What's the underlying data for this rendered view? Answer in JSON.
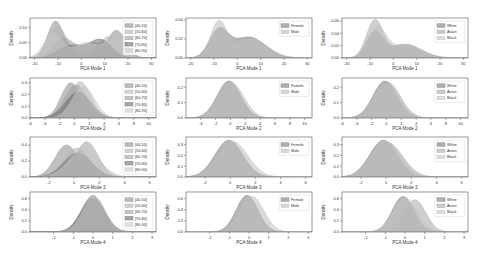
{
  "figure": {
    "rows": 4,
    "cols": 3,
    "ylabel": "Density"
  },
  "legends": {
    "age": [
      "[40-50]",
      "[50-60]",
      "[60-70]",
      "[70-80]",
      "[80-90]"
    ],
    "sex": [
      "Female",
      "Male"
    ],
    "race": [
      "White",
      "Asian",
      "Black"
    ]
  },
  "colors": {
    "age": [
      "#8c8c8c",
      "#b4b4b4",
      "#a0a0a0",
      "#6e6e6e",
      "#c8c8c8"
    ],
    "sex": [
      "#7a7a7a",
      "#bdbdbd"
    ],
    "race": [
      "#7a7a7a",
      "#a8a8a8",
      "#c4c4c4"
    ]
  },
  "chart_data": [
    {
      "type": "area",
      "panel": "r1c1",
      "xlabel": "PCA Mode 1",
      "ylabel": "Density",
      "xlim": [
        -22,
        32
      ],
      "ylim": [
        0,
        0.13
      ],
      "xticks": [
        -20,
        -10,
        0,
        10,
        20,
        30
      ],
      "yticks": [
        0.0,
        0.05,
        0.1
      ],
      "ytick_labels": [
        "0.00",
        "0.05",
        "0.10"
      ],
      "legend_group": "age",
      "series": [
        {
          "name": "[40-50]",
          "peaks": [
            [
              -11,
              0.12,
              3.5
            ],
            [
              15,
              0.09,
              4
            ]
          ]
        },
        {
          "name": "[50-60]",
          "peaks": [
            [
              -10,
              0.1,
              4
            ],
            [
              12,
              0.07,
              5
            ]
          ]
        },
        {
          "name": "[60-70]",
          "peaks": [
            [
              -8,
              0.06,
              4
            ],
            [
              5,
              0.05,
              6
            ]
          ]
        },
        {
          "name": "[70-80]",
          "peaks": [
            [
              -5,
              0.04,
              5
            ],
            [
              8,
              0.06,
              5
            ]
          ]
        },
        {
          "name": "[80-90]",
          "peaks": [
            [
              -12,
              0.08,
              4
            ],
            [
              2,
              0.05,
              5
            ],
            [
              14,
              0.06,
              4
            ]
          ]
        }
      ]
    },
    {
      "type": "area",
      "panel": "r1c2",
      "xlabel": "PCA Mode 1",
      "ylabel": "Density",
      "xlim": [
        -22,
        32
      ],
      "ylim": [
        0,
        0.042
      ],
      "xticks": [
        -20,
        -10,
        0,
        10,
        20,
        30
      ],
      "yticks": [
        0.0,
        0.02,
        0.04
      ],
      "ytick_labels": [
        "0.00",
        "0.02",
        "0.04"
      ],
      "legend_group": "sex",
      "series": [
        {
          "name": "Female",
          "peaks": [
            [
              -8,
              0.028,
              4
            ],
            [
              5,
              0.022,
              7
            ]
          ]
        },
        {
          "name": "Male",
          "peaks": [
            [
              -8,
              0.037,
              3.5
            ],
            [
              6,
              0.02,
              7
            ]
          ]
        }
      ]
    },
    {
      "type": "area",
      "panel": "r1c3",
      "xlabel": "PCA Mode 1",
      "ylabel": "Density",
      "xlim": [
        -22,
        32
      ],
      "ylim": [
        0,
        0.065
      ],
      "xticks": [
        -20,
        -10,
        0,
        10,
        20,
        30
      ],
      "yticks": [
        0.0,
        0.02,
        0.04,
        0.06
      ],
      "ytick_labels": [
        "0.00",
        "0.02",
        "0.04",
        "0.06"
      ],
      "legend_group": "race",
      "series": [
        {
          "name": "White",
          "peaks": [
            [
              -8,
              0.04,
              3.5
            ],
            [
              5,
              0.022,
              7
            ]
          ]
        },
        {
          "name": "Asian",
          "peaks": [
            [
              -8,
              0.06,
              3.5
            ],
            [
              4,
              0.02,
              6
            ]
          ]
        },
        {
          "name": "Black",
          "peaks": [
            [
              -7,
              0.05,
              4
            ],
            [
              6,
              0.022,
              6
            ]
          ]
        }
      ]
    },
    {
      "type": "area",
      "panel": "r2c1",
      "xlabel": "PCA Mode 2",
      "ylabel": "Density",
      "xlim": [
        -6,
        11
      ],
      "ylim": [
        0,
        0.34
      ],
      "xticks": [
        -6,
        -4,
        -2,
        0,
        2,
        4,
        6,
        8,
        10
      ],
      "yticks": [
        0.0,
        0.1,
        0.2,
        0.3
      ],
      "ytick_labels": [
        "0.0",
        "0.1",
        "0.2",
        "0.3"
      ],
      "legend_group": "age",
      "series": [
        {
          "name": "[40-50]",
          "peaks": [
            [
              -0.5,
              0.3,
              1.3
            ]
          ]
        },
        {
          "name": "[50-60]",
          "peaks": [
            [
              0.8,
              0.31,
              1.4
            ]
          ]
        },
        {
          "name": "[60-70]",
          "peaks": [
            [
              0.2,
              0.28,
              1.5
            ]
          ]
        },
        {
          "name": "[70-80]",
          "peaks": [
            [
              0.5,
              0.22,
              1.7
            ]
          ]
        },
        {
          "name": "[80-90]",
          "peaks": [
            [
              1.2,
              0.27,
              1.5
            ]
          ]
        }
      ]
    },
    {
      "type": "area",
      "panel": "r2c2",
      "xlabel": "PCA Mode 2",
      "ylabel": "Density",
      "xlim": [
        -6,
        11
      ],
      "ylim": [
        0,
        0.26
      ],
      "xticks": [
        -4,
        -2,
        0,
        2,
        4,
        6,
        8,
        10
      ],
      "yticks": [
        0.0,
        0.1,
        0.2
      ],
      "ytick_labels": [
        "0.0",
        "0.1",
        "0.2"
      ],
      "legend_group": "sex",
      "series": [
        {
          "name": "Female",
          "peaks": [
            [
              -0.2,
              0.24,
              1.6
            ]
          ]
        },
        {
          "name": "Male",
          "peaks": [
            [
              0.1,
              0.23,
              1.7
            ]
          ]
        }
      ]
    },
    {
      "type": "area",
      "panel": "r2c3",
      "xlabel": "PCA Mode 2",
      "ylabel": "Density",
      "xlim": [
        -6,
        11
      ],
      "ylim": [
        0,
        0.26
      ],
      "xticks": [
        -6,
        -4,
        -2,
        0,
        2,
        4,
        6,
        8,
        10
      ],
      "yticks": [
        0.0,
        0.1,
        0.2
      ],
      "ytick_labels": [
        "0.0",
        "0.1",
        "0.2"
      ],
      "legend_group": "race",
      "series": [
        {
          "name": "White",
          "peaks": [
            [
              -0.2,
              0.24,
              1.6
            ]
          ]
        },
        {
          "name": "Asian",
          "peaks": [
            [
              0.2,
              0.23,
              1.7
            ]
          ]
        },
        {
          "name": "Black",
          "peaks": [
            [
              0,
              0.22,
              1.7
            ]
          ]
        }
      ]
    },
    {
      "type": "area",
      "panel": "r3c1",
      "xlabel": "PCA Mode 3",
      "ylabel": "Density",
      "xlim": [
        -3.5,
        6.5
      ],
      "ylim": [
        0,
        0.5
      ],
      "xticks": [
        -2,
        0,
        2,
        4,
        6
      ],
      "yticks": [
        0.0,
        0.2,
        0.4
      ],
      "ytick_labels": [
        "0.0",
        "0.2",
        "0.4"
      ],
      "legend_group": "age",
      "series": [
        {
          "name": "[40-50]",
          "peaks": [
            [
              -0.6,
              0.4,
              0.9
            ]
          ]
        },
        {
          "name": "[50-60]",
          "peaks": [
            [
              0.2,
              0.36,
              1.0
            ]
          ]
        },
        {
          "name": "[60-70]",
          "peaks": [
            [
              1.0,
              0.44,
              0.9
            ]
          ]
        },
        {
          "name": "[70-80]",
          "peaks": [
            [
              0.3,
              0.3,
              1.1
            ]
          ]
        },
        {
          "name": "[80-90]",
          "peaks": [
            [
              0.8,
              0.35,
              1.2
            ]
          ]
        }
      ]
    },
    {
      "type": "area",
      "panel": "r3c2",
      "xlabel": "PCA Mode 3",
      "ylabel": "Density",
      "xlim": [
        -3.5,
        6.5
      ],
      "ylim": [
        0,
        0.37
      ],
      "xticks": [
        -2,
        0,
        2,
        4,
        6
      ],
      "yticks": [
        0.0,
        0.1,
        0.2,
        0.3
      ],
      "ytick_labels": [
        "0.0",
        "0.1",
        "0.2",
        "0.3"
      ],
      "legend_group": "sex",
      "series": [
        {
          "name": "Female",
          "peaks": [
            [
              -0.1,
              0.34,
              1.1
            ]
          ]
        },
        {
          "name": "Male",
          "peaks": [
            [
              0.2,
              0.33,
              1.2
            ]
          ]
        }
      ]
    },
    {
      "type": "area",
      "panel": "r3c3",
      "xlabel": "PCA Mode 3",
      "ylabel": "Density",
      "xlim": [
        -3.5,
        6.5
      ],
      "ylim": [
        0,
        0.37
      ],
      "xticks": [
        -2,
        0,
        2,
        4,
        6
      ],
      "yticks": [
        0.0,
        0.1,
        0.2,
        0.3
      ],
      "ytick_labels": [
        "0.0",
        "0.1",
        "0.2",
        "0.3"
      ],
      "legend_group": "race",
      "series": [
        {
          "name": "White",
          "peaks": [
            [
              -0.2,
              0.34,
              1.1
            ]
          ]
        },
        {
          "name": "Asian",
          "peaks": [
            [
              0.1,
              0.32,
              1.2
            ]
          ]
        },
        {
          "name": "Black",
          "peaks": [
            [
              0,
              0.33,
              1.15
            ]
          ]
        }
      ]
    },
    {
      "type": "area",
      "panel": "r4c1",
      "xlabel": "PCA Mode 4",
      "ylabel": "Density",
      "xlim": [
        -3.2,
        3.2
      ],
      "ylim": [
        0,
        0.72
      ],
      "xticks": [
        -2,
        -1,
        0,
        1,
        2,
        3
      ],
      "yticks": [
        0.0,
        0.2,
        0.4,
        0.6
      ],
      "ytick_labels": [
        "0.0",
        "0.2",
        "0.4",
        "0.6"
      ],
      "legend_group": "age",
      "series": [
        {
          "name": "[40-50]",
          "peaks": [
            [
              0,
              0.66,
              0.55
            ]
          ]
        },
        {
          "name": "[50-60]",
          "peaks": [
            [
              0.05,
              0.64,
              0.56
            ]
          ]
        },
        {
          "name": "[60-70]",
          "peaks": [
            [
              -0.05,
              0.62,
              0.58
            ]
          ]
        },
        {
          "name": "[70-80]",
          "peaks": [
            [
              0,
              0.6,
              0.6
            ]
          ]
        },
        {
          "name": "[80-90]",
          "peaks": [
            [
              0.05,
              0.63,
              0.57
            ]
          ]
        }
      ]
    },
    {
      "type": "area",
      "panel": "r4c2",
      "xlabel": "PCA Mode 4",
      "ylabel": "Density",
      "xlim": [
        -3.2,
        3.2
      ],
      "ylim": [
        0,
        0.72
      ],
      "xticks": [
        -2,
        -1,
        0,
        1,
        2,
        3
      ],
      "yticks": [
        0.0,
        0.2,
        0.4,
        0.6
      ],
      "ytick_labels": [
        "0.0",
        "0.2",
        "0.4",
        "0.6"
      ],
      "legend_group": "sex",
      "series": [
        {
          "name": "Female",
          "peaks": [
            [
              -0.1,
              0.66,
              0.55
            ]
          ]
        },
        {
          "name": "Male",
          "peaks": [
            [
              0.15,
              0.64,
              0.6
            ]
          ]
        }
      ]
    },
    {
      "type": "area",
      "panel": "r4c3",
      "xlabel": "PCA Mode 4",
      "ylabel": "Density",
      "xlim": [
        -3.2,
        3.2
      ],
      "ylim": [
        0,
        0.72
      ],
      "xticks": [
        -2,
        -1,
        0,
        1,
        2,
        3
      ],
      "yticks": [
        0.0,
        0.2,
        0.4,
        0.6
      ],
      "ytick_labels": [
        "0.0",
        "0.2",
        "0.4",
        "0.6"
      ],
      "legend_group": "race",
      "series": [
        {
          "name": "White",
          "peaks": [
            [
              -0.1,
              0.64,
              0.55
            ]
          ]
        },
        {
          "name": "Asian",
          "peaks": [
            [
              0.5,
              0.58,
              0.55
            ]
          ]
        },
        {
          "name": "Black",
          "peaks": [
            [
              0,
              0.62,
              0.6
            ]
          ]
        }
      ]
    }
  ]
}
